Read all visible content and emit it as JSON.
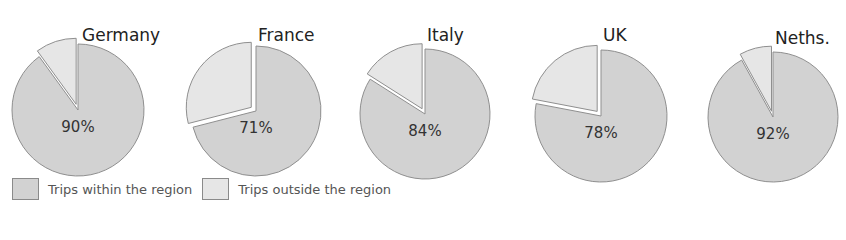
{
  "chart_data": {
    "type": "pie",
    "title": "",
    "legend": [
      {
        "label": "Trips within the region",
        "color": "#d2d2d2"
      },
      {
        "label": "Trips outside the region",
        "color": "#e6e6e6"
      }
    ],
    "legend_position": "bottom-left",
    "pies": [
      {
        "name": "Germany",
        "within": 90,
        "outside": 10,
        "label": "90%"
      },
      {
        "name": "France",
        "within": 71,
        "outside": 29,
        "label": "71%"
      },
      {
        "name": "Italy",
        "within": 84,
        "outside": 16,
        "label": "84%"
      },
      {
        "name": "UK",
        "within": 78,
        "outside": 22,
        "label": "78%"
      },
      {
        "name": "Neths.",
        "within": 92,
        "outside": 8,
        "label": "92%"
      }
    ]
  },
  "colors": {
    "within": "#d2d2d2",
    "outside": "#e6e6e6",
    "stroke": "#8f8f8f"
  }
}
